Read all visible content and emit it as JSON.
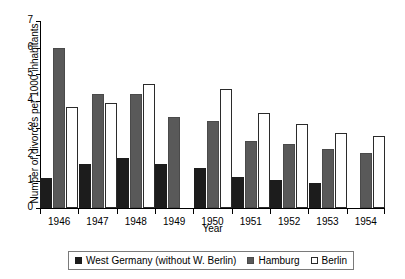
{
  "chart_data": {
    "type": "bar",
    "title": "",
    "xlabel": "Year",
    "ylabel": "Number of divorces per 1000 inhabitants",
    "categories": [
      "1946",
      "1947",
      "1948",
      "1949",
      "1950",
      "1951",
      "1952",
      "1953",
      "1954"
    ],
    "series": [
      {
        "name": "West Germany (without W. Berlin)",
        "color": "#1c1c1c",
        "values": [
          1.12,
          1.65,
          1.87,
          1.65,
          1.5,
          1.15,
          1.05,
          0.95,
          null
        ]
      },
      {
        "name": "Hamburg",
        "color": "#595959",
        "values": [
          6.0,
          4.27,
          4.25,
          3.42,
          3.27,
          2.5,
          2.4,
          2.2,
          2.05
        ]
      },
      {
        "name": "Berlin",
        "color": "#ffffff",
        "values": [
          3.79,
          3.92,
          4.65,
          null,
          4.45,
          3.55,
          3.15,
          2.8,
          2.7
        ]
      }
    ],
    "ylim": [
      0,
      7
    ],
    "yticks": [
      0,
      1,
      2,
      3,
      4,
      5,
      6,
      7
    ],
    "ytick_labels": [
      "0",
      "1",
      "2",
      "3",
      "4",
      "5",
      "6",
      "7"
    ],
    "grid": false,
    "legend_position": "bottom"
  }
}
